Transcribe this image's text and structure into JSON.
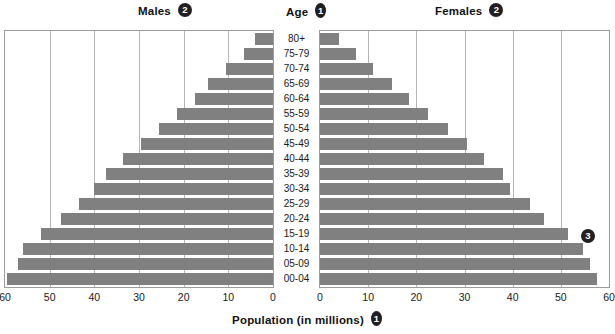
{
  "header": {
    "males_label": "Males",
    "males_callout": "2",
    "age_label": "Age",
    "age_callout": "1",
    "females_label": "Females",
    "females_callout": "2"
  },
  "axis": {
    "title": "Population (in millions)",
    "title_callout": "1",
    "males_ticks": [
      "60",
      "50",
      "40",
      "30",
      "20",
      "10",
      "0"
    ],
    "females_ticks": [
      "0",
      "10",
      "20",
      "30",
      "40",
      "50",
      "60"
    ]
  },
  "callouts": {
    "bars_callout": "3"
  },
  "colors": {
    "bar": "#808080",
    "grid": "#b5b5b5",
    "frame": "#9b9b9b",
    "badge": "#231f20",
    "text": "#1a1a1a",
    "background": "#ffffff"
  },
  "chart_data": {
    "type": "bar",
    "subtype": "population-pyramid",
    "title": "",
    "xlabel": "Population (in millions)",
    "ylabel": "Age",
    "grid": true,
    "legend_position": "top",
    "xlim": [
      0,
      60
    ],
    "xticks": [
      0,
      10,
      20,
      30,
      40,
      50,
      60
    ],
    "categories": [
      "80+",
      "75-79",
      "70-74",
      "65-69",
      "60-64",
      "55-59",
      "50-54",
      "45-49",
      "40-44",
      "35-39",
      "30-34",
      "25-29",
      "20-24",
      "15-19",
      "10-14",
      "05-09",
      "00-04"
    ],
    "series": [
      {
        "name": "Males",
        "direction": "left",
        "values": [
          4.0,
          6.5,
          10.5,
          14.5,
          17.5,
          21.5,
          25.5,
          29.5,
          33.5,
          37.5,
          40.0,
          43.5,
          47.5,
          52.0,
          56.0,
          57.0,
          59.5
        ]
      },
      {
        "name": "Females",
        "direction": "right",
        "values": [
          4.0,
          7.5,
          11.0,
          15.0,
          18.5,
          22.5,
          26.5,
          30.5,
          34.0,
          38.0,
          39.5,
          43.5,
          46.5,
          51.5,
          54.5,
          56.0,
          57.5
        ]
      }
    ]
  }
}
